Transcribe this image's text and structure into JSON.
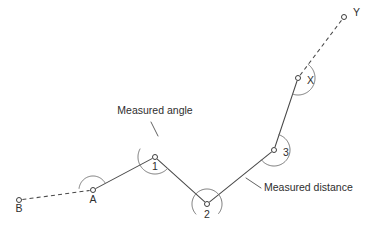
{
  "figure": {
    "title": "Measured angle",
    "type": "survey-traverse-diagram",
    "background_color": "#ffffff",
    "line_color": "#4a4a4a",
    "arc_color": "#6e6e6e",
    "text_color": "#2e2e2e"
  },
  "stations": [
    {
      "id": "B",
      "label": "B",
      "x": 19,
      "y": 200,
      "label_x": 19,
      "label_y": 212,
      "label_anchor": "middle",
      "marker": "circle"
    },
    {
      "id": "A",
      "label": "A",
      "x": 93,
      "y": 190,
      "label_x": 93,
      "label_y": 203,
      "label_anchor": "middle",
      "marker": "circle"
    },
    {
      "id": "1",
      "label": "1",
      "x": 155,
      "y": 157,
      "label_x": 155,
      "label_y": 170,
      "label_anchor": "middle",
      "marker": "circle"
    },
    {
      "id": "2",
      "label": "2",
      "x": 207,
      "y": 204,
      "label_x": 207,
      "label_y": 218,
      "label_anchor": "middle",
      "marker": "circle"
    },
    {
      "id": "3",
      "label": "3",
      "x": 274,
      "y": 150,
      "label_x": 283,
      "label_y": 156,
      "label_anchor": "start",
      "marker": "circle"
    },
    {
      "id": "X",
      "label": "X",
      "x": 298,
      "y": 78,
      "label_x": 307,
      "label_y": 84,
      "label_anchor": "start",
      "marker": "circle"
    },
    {
      "id": "Y",
      "label": "Y",
      "x": 344,
      "y": 17,
      "label_x": 353,
      "label_y": 16,
      "label_anchor": "start",
      "marker": "circle"
    }
  ],
  "segments": [
    {
      "from": "B",
      "to": "A",
      "style": "dashed",
      "kind": "reference-sight-line"
    },
    {
      "from": "A",
      "to": "1",
      "style": "solid",
      "kind": "measured-distance"
    },
    {
      "from": "1",
      "to": "2",
      "style": "solid",
      "kind": "measured-distance"
    },
    {
      "from": "2",
      "to": "3",
      "style": "solid",
      "kind": "measured-distance"
    },
    {
      "from": "3",
      "to": "X",
      "style": "solid",
      "kind": "measured-distance"
    },
    {
      "from": "X",
      "to": "Y",
      "style": "dashed",
      "kind": "reference-sight-line"
    }
  ],
  "angle_arcs": [
    {
      "at": "A",
      "radius": 14,
      "start_deg": 187,
      "end_deg": 332,
      "direction": "counterclockwise"
    },
    {
      "at": "1",
      "radius": 17,
      "start_deg": 42,
      "end_deg": 208,
      "direction": "counterclockwise"
    },
    {
      "at": "2",
      "radius": 15,
      "start_deg": 138,
      "end_deg": 39,
      "direction": "counterclockwise"
    },
    {
      "at": "3",
      "radius": 16,
      "start_deg": 288,
      "end_deg": 141,
      "direction": "counterclockwise"
    },
    {
      "at": "X",
      "radius": 17,
      "start_deg": 307,
      "end_deg": 108,
      "direction": "counterclockwise"
    }
  ],
  "callouts": [
    {
      "id": "measured-angle",
      "text": "Measured angle",
      "text_x": 155,
      "text_y": 114,
      "text_anchor": "middle",
      "leader_from_x": 151,
      "leader_from_y": 122,
      "leader_to_x": 158,
      "leader_to_y": 136
    },
    {
      "id": "measured-distance",
      "text": "Measured distance",
      "text_x": 264,
      "text_y": 191,
      "text_anchor": "start",
      "leader_from_x": 261,
      "leader_from_y": 188,
      "leader_to_x": 246,
      "leader_to_y": 178
    }
  ],
  "footer": {
    "cropped_caption": ""
  }
}
